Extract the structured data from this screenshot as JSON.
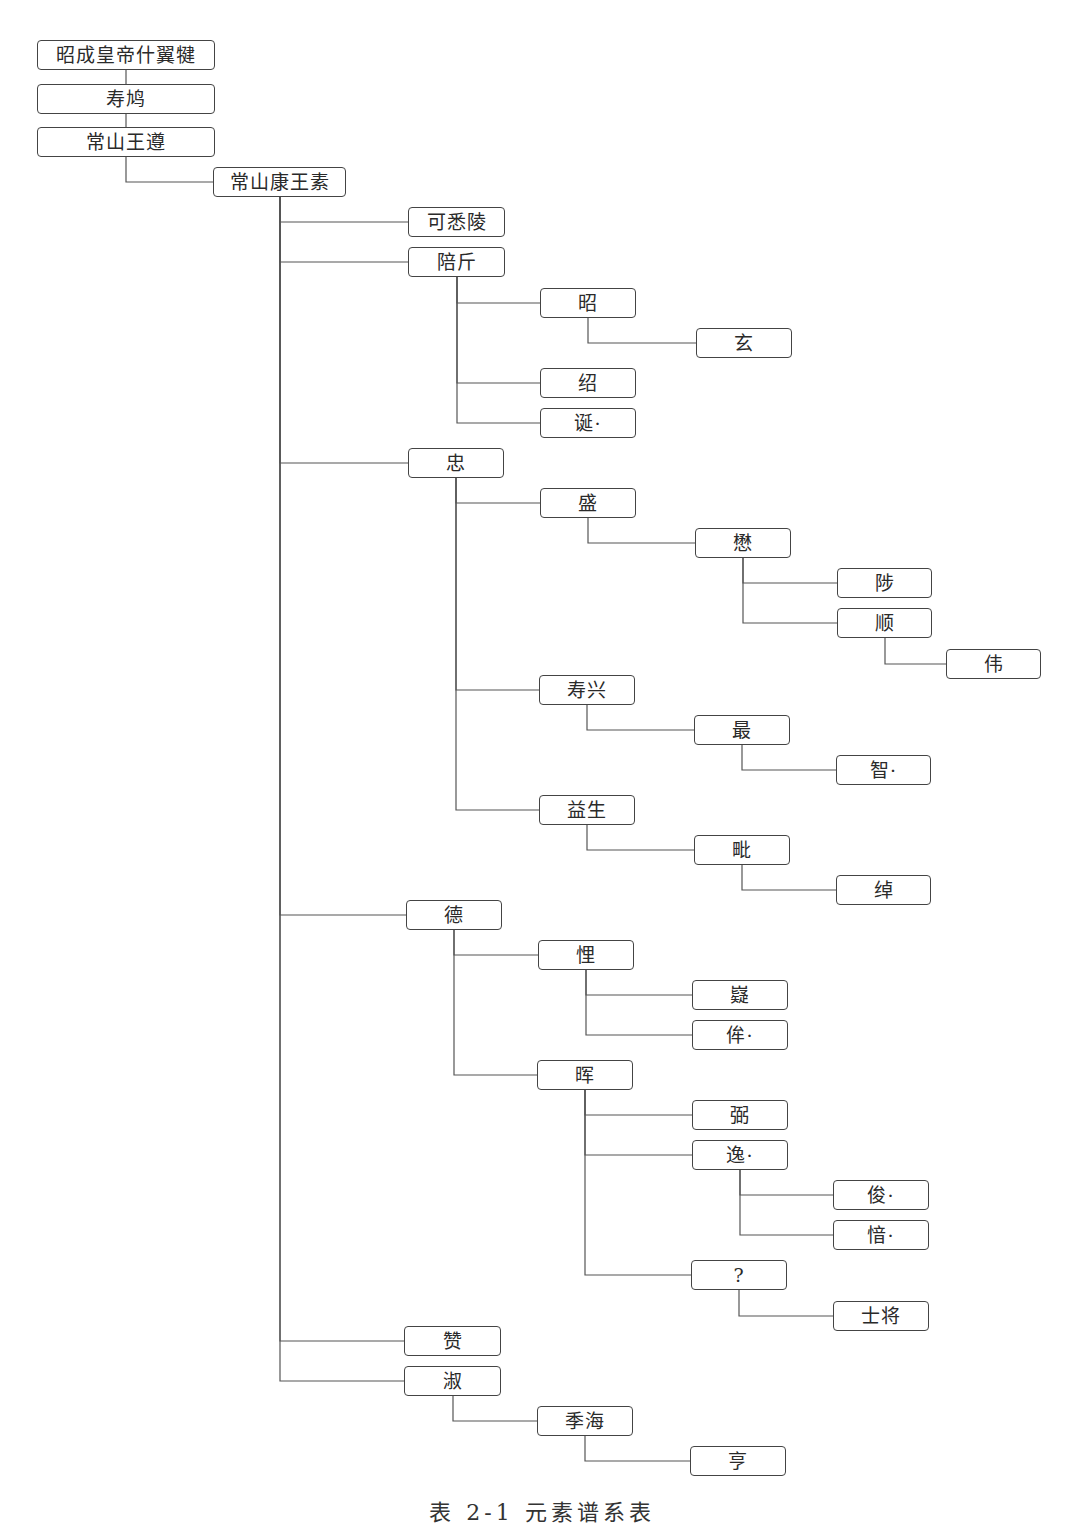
{
  "diagram": {
    "type": "genealogy-tree",
    "caption": "表 2-1  元素谱系表",
    "line_color": "#555555",
    "box_border_color": "#444444",
    "nodes": [
      {
        "id": "n0",
        "label": "昭成皇帝什翼犍",
        "parent": null,
        "x": 37,
        "y": 40,
        "w": 178
      },
      {
        "id": "n1",
        "label": "寿鸠",
        "parent": "n0",
        "x": 37,
        "y": 84,
        "w": 178
      },
      {
        "id": "n2",
        "label": "常山王遵",
        "parent": "n1",
        "x": 37,
        "y": 127,
        "w": 178
      },
      {
        "id": "n3",
        "label": "常山康王素",
        "parent": "n2",
        "x": 213,
        "y": 167,
        "w": 133
      },
      {
        "id": "n4",
        "label": "可悉陵",
        "parent": "n3",
        "x": 408,
        "y": 207,
        "w": 97
      },
      {
        "id": "n5",
        "label": "陪斤",
        "parent": "n3",
        "x": 408,
        "y": 247,
        "w": 97
      },
      {
        "id": "n6",
        "label": "昭",
        "parent": "n5",
        "x": 540,
        "y": 288,
        "w": 96
      },
      {
        "id": "n7",
        "label": "玄",
        "parent": "n6",
        "x": 696,
        "y": 328,
        "w": 96
      },
      {
        "id": "n8",
        "label": "绍",
        "parent": "n5",
        "x": 540,
        "y": 368,
        "w": 96
      },
      {
        "id": "n9",
        "label": "诞·",
        "parent": "n5",
        "x": 540,
        "y": 408,
        "w": 96
      },
      {
        "id": "n10",
        "label": "忠",
        "parent": "n3",
        "x": 408,
        "y": 448,
        "w": 96
      },
      {
        "id": "n11",
        "label": "盛",
        "parent": "n10",
        "x": 540,
        "y": 488,
        "w": 96
      },
      {
        "id": "n12",
        "label": "懋",
        "parent": "n11",
        "x": 695,
        "y": 528,
        "w": 96
      },
      {
        "id": "n13",
        "label": "陟",
        "parent": "n12",
        "x": 837,
        "y": 568,
        "w": 95
      },
      {
        "id": "n14",
        "label": "顺",
        "parent": "n12",
        "x": 837,
        "y": 608,
        "w": 95
      },
      {
        "id": "n15",
        "label": "伟",
        "parent": "n14",
        "x": 946,
        "y": 649,
        "w": 95
      },
      {
        "id": "n16",
        "label": "寿兴",
        "parent": "n10",
        "x": 539,
        "y": 675,
        "w": 96
      },
      {
        "id": "n17",
        "label": "最",
        "parent": "n16",
        "x": 694,
        "y": 715,
        "w": 96
      },
      {
        "id": "n18",
        "label": "智·",
        "parent": "n17",
        "x": 836,
        "y": 755,
        "w": 95
      },
      {
        "id": "n19",
        "label": "益生",
        "parent": "n10",
        "x": 539,
        "y": 795,
        "w": 96
      },
      {
        "id": "n20",
        "label": "毗",
        "parent": "n19",
        "x": 694,
        "y": 835,
        "w": 96
      },
      {
        "id": "n21",
        "label": "绰",
        "parent": "n20",
        "x": 836,
        "y": 875,
        "w": 95
      },
      {
        "id": "n22",
        "label": "德",
        "parent": "n3",
        "x": 406,
        "y": 900,
        "w": 96
      },
      {
        "id": "n23",
        "label": "悝",
        "parent": "n22",
        "x": 538,
        "y": 940,
        "w": 96
      },
      {
        "id": "n24",
        "label": "嶷",
        "parent": "n23",
        "x": 692,
        "y": 980,
        "w": 96
      },
      {
        "id": "n25",
        "label": "侔·",
        "parent": "n23",
        "x": 692,
        "y": 1020,
        "w": 96
      },
      {
        "id": "n26",
        "label": "晖",
        "parent": "n22",
        "x": 537,
        "y": 1060,
        "w": 96
      },
      {
        "id": "n27",
        "label": "弼",
        "parent": "n26",
        "x": 692,
        "y": 1100,
        "w": 96
      },
      {
        "id": "n28",
        "label": "逸·",
        "parent": "n26",
        "x": 692,
        "y": 1140,
        "w": 96
      },
      {
        "id": "n29",
        "label": "俊·",
        "parent": "n28",
        "x": 833,
        "y": 1180,
        "w": 96
      },
      {
        "id": "n30",
        "label": "愔·",
        "parent": "n28",
        "x": 833,
        "y": 1220,
        "w": 96
      },
      {
        "id": "n31",
        "label": "?",
        "parent": "n26",
        "x": 691,
        "y": 1260,
        "w": 96
      },
      {
        "id": "n32",
        "label": "士将",
        "parent": "n31",
        "x": 833,
        "y": 1301,
        "w": 96
      },
      {
        "id": "n33",
        "label": "赞",
        "parent": "n3",
        "x": 404,
        "y": 1326,
        "w": 97
      },
      {
        "id": "n34",
        "label": "淑",
        "parent": "n3",
        "x": 404,
        "y": 1366,
        "w": 97
      },
      {
        "id": "n35",
        "label": "季海",
        "parent": "n34",
        "x": 537,
        "y": 1406,
        "w": 96
      },
      {
        "id": "n36",
        "label": "亨",
        "parent": "n35",
        "x": 690,
        "y": 1446,
        "w": 96
      }
    ]
  }
}
